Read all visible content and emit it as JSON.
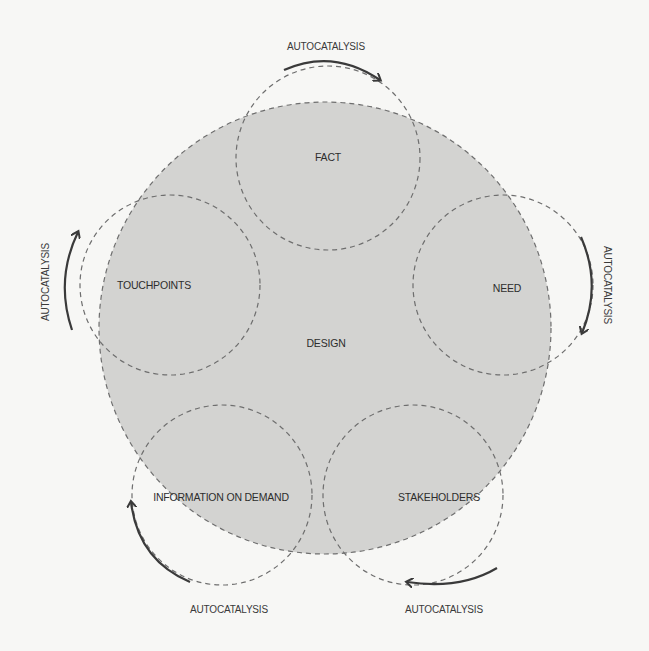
{
  "diagram": {
    "center": {
      "label": "DESIGN"
    },
    "nodes": [
      {
        "id": "fact",
        "label": "FACT"
      },
      {
        "id": "need",
        "label": "NEED"
      },
      {
        "id": "stakeholders",
        "label": "STAKEHOLDERS"
      },
      {
        "id": "information",
        "label": "INFORMATION ON DEMAND"
      },
      {
        "id": "touchpoints",
        "label": "TOUCHPOINTS"
      }
    ],
    "arrows": [
      {
        "label": "AUTOCATALYSIS",
        "position": "top"
      },
      {
        "label": "AUTOCATALYSIS",
        "position": "right"
      },
      {
        "label": "AUTOCATALYSIS",
        "position": "bottom-right"
      },
      {
        "label": "AUTOCATALYSIS",
        "position": "bottom-left"
      },
      {
        "label": "AUTOCATALYSIS",
        "position": "left"
      }
    ],
    "colors": {
      "fill": "#d3d3d1",
      "stroke": "#6e6e6e",
      "arrow": "#3a3a3a",
      "background": "#f7f7f5"
    }
  }
}
